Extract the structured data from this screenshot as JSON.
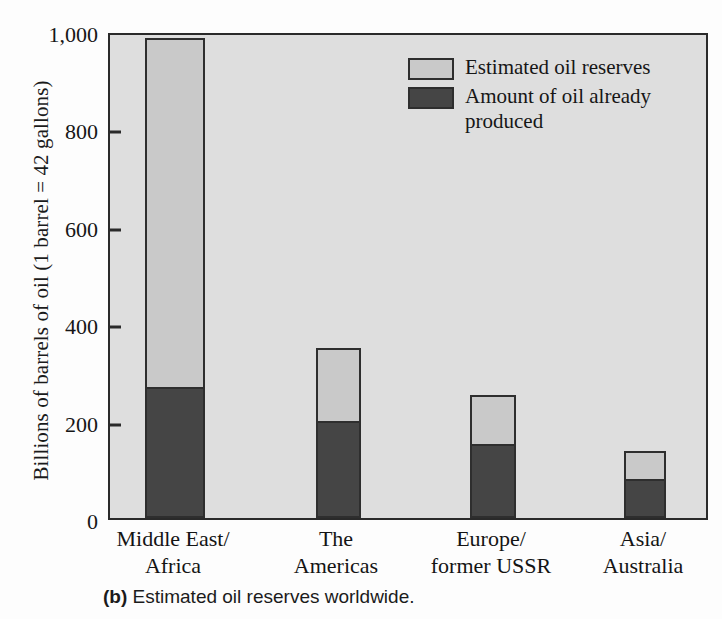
{
  "chart_data": {
    "type": "bar",
    "subtype": "stacked",
    "title": "",
    "xlabel": "",
    "ylabel": "Billions of barrels of oil (1 barrel = 42 gallons)",
    "ylim": [
      0,
      1000
    ],
    "yticks": [
      "0",
      "200",
      "400",
      "600",
      "800",
      "1,000"
    ],
    "ytick_values": [
      0,
      200,
      400,
      600,
      800,
      1000
    ],
    "grid": false,
    "legend_position": "top-right",
    "categories": [
      "Middle East/ Africa",
      "The Americas",
      "Europe/ former USSR",
      "Asia/ Australia"
    ],
    "category_lines": [
      [
        "Middle East/",
        "Africa"
      ],
      [
        "The",
        "Americas"
      ],
      [
        "Europe/",
        "former USSR"
      ],
      [
        "Asia/",
        "Australia"
      ]
    ],
    "series": [
      {
        "name": "Amount of oil already produced",
        "color": "#454545",
        "values": [
          270,
          200,
          152,
          80
        ]
      },
      {
        "name": "Estimated oil reserves",
        "color": "#c9c9c9",
        "values": [
          715,
          150,
          100,
          58
        ]
      }
    ],
    "totals": [
      985,
      350,
      252,
      138
    ]
  },
  "legend": {
    "items": [
      {
        "label": "Estimated oil reserves",
        "swatch": "light"
      },
      {
        "label": "Amount of oil already produced",
        "swatch": "dark"
      }
    ]
  },
  "caption": {
    "tag": "(b)",
    "text": "Estimated oil reserves worldwide."
  },
  "colors": {
    "plot_background": "#dedede",
    "bar_light": "#c9c9c9",
    "bar_dark": "#454545",
    "axis": "#2a2a2a",
    "text": "#161616"
  }
}
